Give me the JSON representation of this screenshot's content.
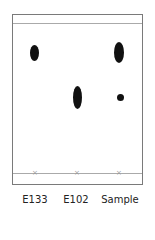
{
  "diagram": {
    "type": "paper-chromatography",
    "lanes": [
      {
        "label": "E133",
        "spots": [
          {
            "y_center": 53,
            "size": "medium"
          }
        ]
      },
      {
        "label": "E102",
        "spots": [
          {
            "y_center": 97,
            "size": "large"
          }
        ]
      },
      {
        "label": "Sample",
        "spots": [
          {
            "y_center": 52,
            "size": "large"
          },
          {
            "y_center": 97,
            "size": "small"
          }
        ]
      }
    ],
    "baseline_marker": "×",
    "solvent_front": true
  },
  "labels": {
    "lane1": "E133",
    "lane2": "E102",
    "lane3": "Sample"
  },
  "markers": {
    "m1": "×",
    "m2": "×",
    "m3": "×"
  }
}
